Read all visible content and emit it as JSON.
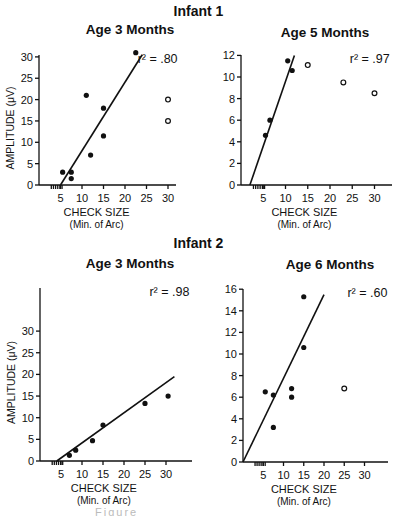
{
  "figure": {
    "infant1_title": "Infant 1",
    "infant2_title": "Infant 2",
    "caption": "Figure"
  },
  "chart_data": [
    {
      "id": "p1",
      "type": "scatter",
      "group": "Infant 1",
      "title": "Age 3 Months",
      "xlabel": "CHECK SIZE",
      "xlabel_sub": "(Min. of Arc)",
      "ylabel": "AMPLITUDE (μV)",
      "annotation": "r² = .80",
      "xlim": [
        0,
        35
      ],
      "ylim": [
        0,
        30
      ],
      "xticks": [
        5,
        10,
        15,
        20,
        25,
        30
      ],
      "yticks": [
        0,
        5,
        10,
        15,
        20,
        25,
        30
      ],
      "filled": [
        [
          5.5,
          3
        ],
        [
          7.5,
          3
        ],
        [
          7.5,
          1.5
        ],
        [
          11,
          21
        ],
        [
          12,
          7
        ],
        [
          15,
          18
        ],
        [
          15,
          11.5
        ],
        [
          22.5,
          31
        ]
      ],
      "open": [
        [
          30,
          20
        ],
        [
          30,
          15
        ]
      ],
      "fit_line": [
        [
          5,
          0
        ],
        [
          24,
          30.5
        ]
      ],
      "frame": {
        "x0": 39,
        "xscale": 4.3,
        "y0": 185,
        "yscale": 4.27,
        "ytop": 55,
        "xend": 176
      }
    },
    {
      "id": "p2",
      "type": "scatter",
      "group": "Infant 1",
      "title": "Age 5 Months",
      "xlabel": "CHECK SIZE",
      "xlabel_sub": "(Min. of Arc)",
      "ylabel": "",
      "annotation": "r² = .97",
      "xlim": [
        0,
        35
      ],
      "ylim": [
        0,
        12
      ],
      "xticks": [
        5,
        10,
        15,
        20,
        25,
        30
      ],
      "yticks": [
        0,
        2,
        4,
        6,
        8,
        10,
        12
      ],
      "filled": [
        [
          5.5,
          4.6
        ],
        [
          6.5,
          6.0
        ],
        [
          10.5,
          11.5
        ],
        [
          11.5,
          10.6
        ]
      ],
      "open": [
        [
          15,
          11.1
        ],
        [
          23,
          9.5
        ],
        [
          30,
          8.5
        ]
      ],
      "fit_line": [
        [
          2,
          0
        ],
        [
          12,
          12
        ]
      ],
      "frame": {
        "x0": 241,
        "xscale": 4.45,
        "y0": 185,
        "yscale": 10.8,
        "ytop": 55,
        "xend": 392
      }
    },
    {
      "id": "p3",
      "type": "scatter",
      "group": "Infant 2",
      "title": "Age 3 Months",
      "xlabel": "CHECK SIZE",
      "xlabel_sub": "(Min. of Arc)",
      "ylabel": "AMPLITUDE (μV)",
      "annotation": "r² = .98",
      "xlim": [
        0,
        35
      ],
      "ylim": [
        0,
        30
      ],
      "xticks": [
        5,
        10,
        15,
        20,
        25,
        30
      ],
      "yticks": [
        0,
        5,
        10,
        15,
        20,
        25,
        30
      ],
      "filled": [
        [
          7,
          1.3
        ],
        [
          8.5,
          2.5
        ],
        [
          12.5,
          4.7
        ],
        [
          15,
          8.3
        ],
        [
          25,
          13.3
        ],
        [
          30.5,
          15
        ]
      ],
      "open": [],
      "fit_line": [
        [
          4,
          0
        ],
        [
          32,
          19.5
        ]
      ],
      "frame": {
        "x0": 40,
        "xscale": 4.2,
        "y0": 461,
        "yscale": 4.33,
        "ytop": 288,
        "xend": 192
      }
    },
    {
      "id": "p4",
      "type": "scatter",
      "group": "Infant 2",
      "title": "Age 6 Months",
      "xlabel": "CHECK SIZE",
      "xlabel_sub": "(Min. of Arc)",
      "ylabel": "",
      "annotation": "r² = .60",
      "xlim": [
        0,
        35
      ],
      "ylim": [
        0,
        16
      ],
      "xticks": [
        5,
        10,
        15,
        20,
        25,
        30
      ],
      "yticks": [
        0,
        2,
        4,
        6,
        8,
        10,
        12,
        14,
        16
      ],
      "filled": [
        [
          5.5,
          6.5
        ],
        [
          7.5,
          6.2
        ],
        [
          7.5,
          3.2
        ],
        [
          12,
          6.8
        ],
        [
          12,
          6.0
        ],
        [
          15,
          15.3
        ],
        [
          15,
          10.6
        ]
      ],
      "open": [
        [
          25,
          6.8
        ]
      ],
      "fit_line": [
        [
          0,
          0
        ],
        [
          20,
          15.5
        ]
      ],
      "frame": {
        "x0": 243,
        "xscale": 4.05,
        "y0": 462,
        "yscale": 10.8,
        "ytop": 289,
        "xend": 388
      }
    }
  ]
}
